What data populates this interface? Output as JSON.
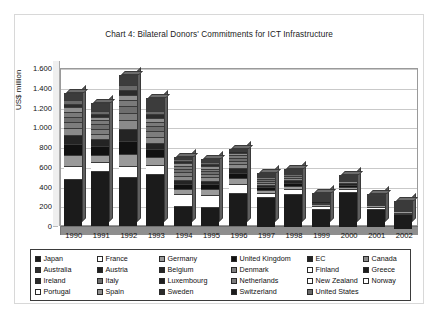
{
  "chart_title": "Chart 4: Bilateral Donors' Commitments for ICT Infrastructure",
  "axis": {
    "y_title": "US$ million",
    "y_ticks": [
      "1.600",
      "1.400",
      "1.200",
      "1.000",
      "800",
      "600",
      "400",
      "200",
      "0"
    ]
  },
  "legend": {
    "entries": [
      {
        "label": "Japan",
        "color": "#1b1b1b"
      },
      {
        "label": "France",
        "color": "#ffffff"
      },
      {
        "label": "Germany",
        "color": "#9a9a9a"
      },
      {
        "label": "United Kingdom",
        "color": "#111111"
      },
      {
        "label": "EC",
        "color": "#242424"
      },
      {
        "label": "Canada",
        "color": "#8a8a8a"
      },
      {
        "label": "Australia",
        "color": "#2e2e2e"
      },
      {
        "label": "Austria",
        "color": "#1f1f1f"
      },
      {
        "label": "Belgium",
        "color": "#262626"
      },
      {
        "label": "Denmark",
        "color": "#7d7d7d"
      },
      {
        "label": "Finland",
        "color": "#ffffff"
      },
      {
        "label": "Greece",
        "color": "#1d1d1d"
      },
      {
        "label": "Ireland",
        "color": "#2a2a2a"
      },
      {
        "label": "Italy",
        "color": "#6e6e6e"
      },
      {
        "label": "Luxembourg",
        "color": "#202020"
      },
      {
        "label": "Netherlands",
        "color": "#7a7a7a"
      },
      {
        "label": "New Zealand",
        "color": "#ffffff"
      },
      {
        "label": "Norway",
        "color": "#ffffff"
      },
      {
        "label": "Portugal",
        "color": "#ffffff"
      },
      {
        "label": "Spain",
        "color": "#8f8f8f"
      },
      {
        "label": "Sweden",
        "color": "#2b2b2b"
      },
      {
        "label": "Switzerland",
        "color": "#1c1c1c"
      },
      {
        "label": "United States",
        "color": "#6a6a6a"
      }
    ]
  },
  "chart_data": {
    "type": "bar",
    "stacked": true,
    "title": "Chart 4: Bilateral Donors' Commitments for ICT Infrastructure",
    "xlabel": "",
    "ylabel": "US$ million",
    "ylim": [
      0,
      1600
    ],
    "ytick_step": 200,
    "grid": true,
    "legend_position": "bottom",
    "categories": [
      "1990",
      "1991",
      "1992",
      "1993",
      "1994",
      "1995",
      "1996",
      "1997",
      "1998",
      "1999",
      "2000",
      "2001",
      "2002"
    ],
    "totals": [
      1250,
      1150,
      1430,
      1200,
      700,
      680,
      780,
      540,
      580,
      330,
      520,
      310,
      250
    ],
    "series": [
      {
        "name": "Japan",
        "color": "#1b1b1b",
        "values": [
          480,
          560,
          500,
          530,
          205,
          190,
          330,
          300,
          330,
          180,
          355,
          185,
          150
        ]
      },
      {
        "name": "France",
        "color": "#ffffff",
        "values": [
          130,
          90,
          110,
          90,
          115,
          125,
          95,
          45,
          55,
          35,
          25,
          20,
          15
        ]
      },
      {
        "name": "Germany",
        "color": "#9a9a9a",
        "values": [
          110,
          70,
          120,
          75,
          55,
          60,
          60,
          30,
          35,
          15,
          25,
          15,
          15
        ]
      },
      {
        "name": "United Kingdom",
        "color": "#111111",
        "values": [
          105,
          85,
          135,
          80,
          50,
          45,
          55,
          30,
          30,
          15,
          20,
          15,
          10
        ]
      },
      {
        "name": "EC",
        "color": "#242424",
        "values": [
          95,
          75,
          115,
          70,
          45,
          40,
          45,
          25,
          25,
          15,
          20,
          10,
          10
        ]
      },
      {
        "name": "Canada",
        "color": "#8a8a8a",
        "values": [
          70,
          55,
          90,
          60,
          40,
          35,
          40,
          20,
          20,
          10,
          15,
          10,
          10
        ]
      },
      {
        "name": "Denmark",
        "color": "#7d7d7d",
        "values": [
          60,
          50,
          75,
          55,
          35,
          30,
          35,
          20,
          20,
          10,
          15,
          10,
          8
        ]
      },
      {
        "name": "Italy",
        "color": "#6e6e6e",
        "values": [
          55,
          45,
          70,
          50,
          35,
          30,
          30,
          18,
          18,
          10,
          12,
          10,
          8
        ]
      },
      {
        "name": "Netherlands",
        "color": "#7a7a7a",
        "values": [
          50,
          40,
          60,
          45,
          30,
          25,
          25,
          15,
          15,
          8,
          10,
          8,
          6
        ]
      },
      {
        "name": "Spain",
        "color": "#8f8f8f",
        "values": [
          45,
          35,
          55,
          40,
          25,
          25,
          25,
          15,
          12,
          8,
          10,
          8,
          6
        ]
      },
      {
        "name": "Sweden",
        "color": "#2b2b2b",
        "values": [
          40,
          30,
          50,
          35,
          22,
          22,
          20,
          12,
          10,
          8,
          8,
          8,
          5
        ]
      },
      {
        "name": "United States",
        "color": "#6a6a6a",
        "values": [
          35,
          28,
          45,
          32,
          20,
          20,
          10,
          5,
          5,
          8,
          5,
          5,
          4
        ]
      },
      {
        "name": "Other donors",
        "color": "#3c3c3c",
        "values": [
          75,
          87,
          105,
          138,
          23,
          33,
          10,
          5,
          5,
          8,
          0,
          16,
          3
        ]
      }
    ]
  }
}
